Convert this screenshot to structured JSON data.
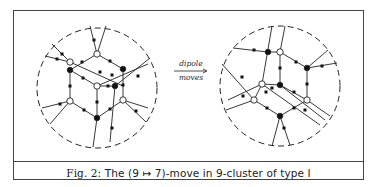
{
  "figure": {
    "caption_prefix": "Fig. 2:",
    "caption_text": "The (9 ↦ 7)-move in 9-cluster of type I",
    "arrow": {
      "label_top": "dipole",
      "label_bottom": "moves"
    },
    "colors": {
      "stroke": "#222222",
      "frame": "#444444",
      "white_node": "#ffffff",
      "black_node": "#111111",
      "background": "#ffffff"
    },
    "left_diagram": {
      "name": "before-move",
      "circle": {
        "cx": 97,
        "cy": 88,
        "r": 60
      },
      "white_nodes": [
        [
          97,
          54
        ],
        [
          70,
          62
        ],
        [
          97,
          86
        ],
        [
          70,
          101
        ],
        [
          123,
          100
        ]
      ],
      "black_nodes": [
        [
          70,
          70
        ],
        [
          123,
          69
        ],
        [
          115,
          86
        ],
        [
          97,
          118
        ]
      ],
      "edges": [
        [
          [
            97,
            54
          ],
          [
            70,
            70
          ]
        ],
        [
          [
            97,
            54
          ],
          [
            123,
            69
          ]
        ],
        [
          [
            70,
            70
          ],
          [
            70,
            101
          ]
        ],
        [
          [
            123,
            69
          ],
          [
            123,
            100
          ]
        ],
        [
          [
            70,
            101
          ],
          [
            97,
            118
          ]
        ],
        [
          [
            123,
            100
          ],
          [
            97,
            118
          ]
        ],
        [
          [
            97,
            86
          ],
          [
            70,
            70
          ]
        ],
        [
          [
            97,
            86
          ],
          [
            115,
            86
          ]
        ],
        [
          [
            97,
            86
          ],
          [
            97,
            118
          ]
        ],
        [
          [
            70,
            62
          ],
          [
            123,
            86
          ]
        ],
        [
          [
            97,
            86
          ],
          [
            148,
            64
          ]
        ],
        [
          [
            115,
            86
          ],
          [
            110,
            142
          ]
        ],
        [
          [
            97,
            54
          ],
          [
            90,
            26
          ]
        ],
        [
          [
            97,
            54
          ],
          [
            106,
            26
          ]
        ],
        [
          [
            70,
            62
          ],
          [
            52,
            44
          ]
        ],
        [
          [
            70,
            62
          ],
          [
            45,
            56
          ]
        ],
        [
          [
            70,
            101
          ],
          [
            42,
            108
          ]
        ],
        [
          [
            70,
            101
          ],
          [
            50,
            124
          ]
        ],
        [
          [
            123,
            100
          ],
          [
            148,
            108
          ]
        ],
        [
          [
            123,
            100
          ],
          [
            146,
            122
          ]
        ],
        [
          [
            97,
            118
          ],
          [
            93,
            147
          ]
        ],
        [
          [
            115,
            86
          ],
          [
            150,
            58
          ]
        ]
      ],
      "edge_markers": [
        [
          94,
          40
        ],
        [
          62,
          54
        ],
        [
          57,
          59
        ],
        [
          82,
          62
        ],
        [
          110,
          61
        ],
        [
          83,
          78
        ],
        [
          70,
          86
        ],
        [
          123,
          85
        ],
        [
          97,
          102
        ],
        [
          108,
          86
        ],
        [
          84,
          110
        ],
        [
          110,
          109
        ],
        [
          60,
          104
        ],
        [
          136,
          111
        ],
        [
          112,
          128
        ],
        [
          100,
          72
        ],
        [
          138,
          76
        ],
        [
          112,
          75
        ]
      ]
    },
    "right_diagram": {
      "name": "after-move",
      "circle": {
        "cx": 280,
        "cy": 86,
        "r": 60
      },
      "white_nodes": [
        [
          280,
          52
        ],
        [
          262,
          84
        ],
        [
          254,
          100
        ],
        [
          307,
          100
        ]
      ],
      "black_nodes": [
        [
          307,
          68
        ],
        [
          280,
          85
        ],
        [
          280,
          116
        ],
        [
          268,
          52
        ]
      ],
      "edges": [
        [
          [
            280,
            52
          ],
          [
            307,
            68
          ]
        ],
        [
          [
            307,
            68
          ],
          [
            307,
            100
          ]
        ],
        [
          [
            280,
            52
          ],
          [
            280,
            85
          ]
        ],
        [
          [
            262,
            84
          ],
          [
            280,
            85
          ]
        ],
        [
          [
            280,
            85
          ],
          [
            307,
            100
          ]
        ],
        [
          [
            254,
            100
          ],
          [
            280,
            116
          ]
        ],
        [
          [
            307,
            100
          ],
          [
            280,
            116
          ]
        ],
        [
          [
            262,
            84
          ],
          [
            254,
            100
          ]
        ],
        [
          [
            262,
            84
          ],
          [
            272,
            26
          ]
        ],
        [
          [
            280,
            52
          ],
          [
            285,
            26
          ]
        ],
        [
          [
            233,
            48
          ],
          [
            268,
            52
          ]
        ],
        [
          [
            268,
            52
          ],
          [
            280,
            52
          ]
        ],
        [
          [
            307,
            68
          ],
          [
            328,
            50
          ]
        ],
        [
          [
            307,
            68
          ],
          [
            337,
            63
          ]
        ],
        [
          [
            254,
            100
          ],
          [
            226,
            110
          ]
        ],
        [
          [
            254,
            100
          ],
          [
            222,
            64
          ]
        ],
        [
          [
            262,
            84
          ],
          [
            228,
            100
          ]
        ],
        [
          [
            280,
            85
          ],
          [
            325,
            120
          ]
        ],
        [
          [
            262,
            84
          ],
          [
            320,
            125
          ]
        ],
        [
          [
            307,
            100
          ],
          [
            330,
            116
          ]
        ],
        [
          [
            280,
            116
          ],
          [
            272,
            146
          ]
        ],
        [
          [
            280,
            116
          ],
          [
            290,
            145
          ]
        ]
      ],
      "edge_markers": [
        [
          254,
          50
        ],
        [
          280,
          68
        ],
        [
          296,
          62
        ],
        [
          307,
          84
        ],
        [
          294,
          92
        ],
        [
          266,
          92
        ],
        [
          267,
          108
        ],
        [
          294,
          108
        ],
        [
          242,
          77
        ],
        [
          243,
          96
        ],
        [
          284,
          128
        ],
        [
          322,
          66
        ],
        [
          272,
          88
        ],
        [
          305,
          110
        ]
      ]
    }
  }
}
